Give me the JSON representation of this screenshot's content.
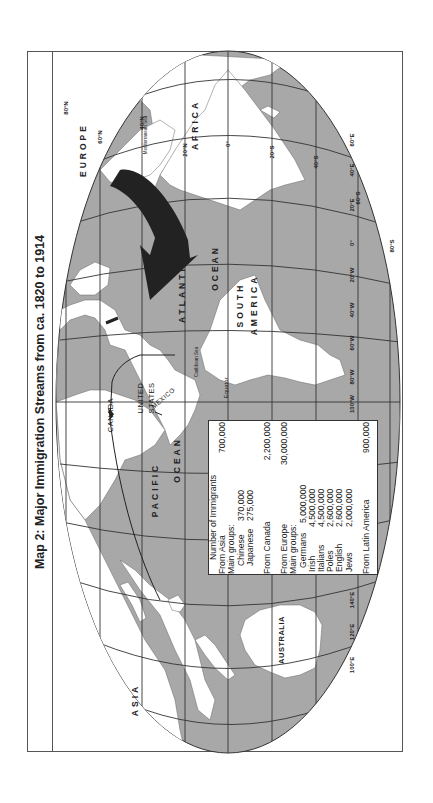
{
  "title": "Map 2: Major Immigration Streams from ca. 1820 to 1914",
  "colors": {
    "ocean": "#a8a8a8",
    "land": "#ffffff",
    "grid": "#333333",
    "arrow_europe": "#222222",
    "frame": "#555555"
  },
  "labels": {
    "continents": {
      "europe": "EUROPE",
      "africa": "AFRICA",
      "asia": "ASIA",
      "australia": "AUSTRALIA",
      "south_america": "SOUTH AMERICA",
      "south": "SOUTH",
      "america": "AMERICA"
    },
    "countries": {
      "canada": "CANADA",
      "united": "UNITED",
      "states": "STATES",
      "mexico": "MEXICO"
    },
    "oceans": {
      "atlantic": "ATLANTIC",
      "atlantic_ocean": "OCEAN",
      "pacific": "PACIFIC",
      "pacific_ocean": "OCEAN"
    },
    "seas": {
      "caribbean": "Caribbean Sea",
      "mediterranean": "Mediterranean Sea"
    },
    "equator": "Equator"
  },
  "latitude_ticks": [
    "80°N",
    "60°N",
    "40°N",
    "20°N",
    "0°",
    "20°S",
    "40°S",
    "60°S",
    "80°S"
  ],
  "longitude_ticks": [
    "60°E",
    "40°E",
    "20°E",
    "0°",
    "20°W",
    "40°W",
    "60°W",
    "80°W",
    "100°W",
    "140°E",
    "120°E",
    "100°E"
  ],
  "legend": {
    "heading": "Number of Immigrants",
    "asia": {
      "label": "From Asia",
      "value": "700,000",
      "main_groups_label": "Main groups:",
      "groups": [
        {
          "name": "Chinese",
          "value": "370,000"
        },
        {
          "name": "Japanese",
          "value": "275,000"
        }
      ]
    },
    "canada": {
      "label": "From Canada",
      "value": "2,200,000"
    },
    "europe": {
      "label": "From Europe",
      "value": "30,000,000",
      "main_groups_label": "Main groups:",
      "groups": [
        {
          "name": "Germans",
          "value": "5,000,000"
        },
        {
          "name": "Irish",
          "value": "4,500,000"
        },
        {
          "name": "Italians",
          "value": "4,500,000"
        },
        {
          "name": "Poles",
          "value": "2,600,000"
        },
        {
          "name": "English",
          "value": "2,600,000"
        },
        {
          "name": "Jews",
          "value": "2,000,000"
        }
      ]
    },
    "latin_america": {
      "label": "From Latin America",
      "value": "900,000"
    }
  }
}
